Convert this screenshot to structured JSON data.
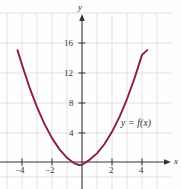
{
  "figure": {
    "background_color": "#fefefe",
    "grid_color": "#dcdcdc",
    "axis_color": "#333333",
    "curve_color": "#8c1f38",
    "text_color": "#2b2b2b"
  },
  "axes": {
    "x_axis_label": "x",
    "y_axis_label": "y",
    "x_ticks": [
      {
        "value": -4,
        "label": "−4"
      },
      {
        "value": -2,
        "label": "−2"
      },
      {
        "value": 2,
        "label": "2"
      },
      {
        "value": 4,
        "label": "4"
      }
    ],
    "y_ticks": [
      {
        "value": 4,
        "label": "4"
      },
      {
        "value": 8,
        "label": "8"
      },
      {
        "value": 12,
        "label": "12"
      },
      {
        "value": 16,
        "label": "16"
      }
    ]
  },
  "annotations": {
    "curve_label": "y = f(x)"
  },
  "chart_data": {
    "type": "line",
    "title": "",
    "xlabel": "x",
    "ylabel": "y",
    "xlim": [
      -4.8,
      5.0
    ],
    "ylim": [
      -2.6,
      18.5
    ],
    "grid": true,
    "legend": "none",
    "xticks": [
      -4,
      -2,
      2,
      4
    ],
    "yticks": [
      4,
      8,
      12,
      16
    ],
    "series": [
      {
        "name": "y = f(x)",
        "color": "#8c1f38",
        "x": [
          -4.3,
          -4.0,
          -3.5,
          -3.0,
          -2.5,
          -2.0,
          -1.5,
          -1.0,
          -0.5,
          -0.2,
          0.0,
          0.5,
          1.0,
          1.5,
          2.0,
          2.5,
          3.0,
          3.5,
          4.0,
          4.35
        ],
        "y": [
          15.0,
          13.04,
          10.01,
          7.36,
          5.09,
          3.2,
          1.69,
          0.56,
          -0.19,
          -0.4,
          -0.36,
          0.29,
          1.16,
          2.41,
          4.04,
          6.05,
          8.44,
          11.21,
          14.36,
          15.0
        ]
      }
    ],
    "vertex": {
      "x": -0.2,
      "y": -0.4
    }
  }
}
